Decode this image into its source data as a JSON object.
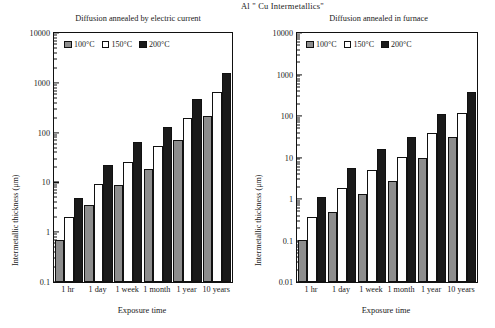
{
  "figure": {
    "main_title": "Al \" Cu Intermetallics\""
  },
  "chart_data": [
    {
      "type": "bar",
      "title": "Diffusion annealed by electric current",
      "xlabel": "Exposure time",
      "ylabel": "Intermetallic thickness (μm)",
      "yscale": "log",
      "ylim": [
        0.1,
        10000
      ],
      "ytick_labels": [
        "0.1",
        "1",
        "10",
        "100",
        "1000",
        "10000"
      ],
      "ytick_values": [
        0.1,
        1,
        10,
        100,
        1000,
        10000
      ],
      "grid": false,
      "legend_position": "upper-left-inside",
      "categories": [
        "1 hr",
        "1 day",
        "1 week",
        "1 month",
        "1 year",
        "10 years"
      ],
      "series": [
        {
          "name": "100°C",
          "color": "#8d8d8d",
          "values": [
            0.7,
            3.5,
            9,
            19,
            70,
            220
          ]
        },
        {
          "name": "150°C",
          "color": "#ffffff",
          "values": [
            2,
            9.5,
            26,
            55,
            200,
            650
          ]
        },
        {
          "name": "200°C",
          "color": "#1a1a1a",
          "values": [
            4.8,
            22,
            65,
            130,
            480,
            1550
          ]
        }
      ]
    },
    {
      "type": "bar",
      "title": "Diffusion annealed in furnace",
      "xlabel": "Exposure time",
      "ylabel": "Intermetallic thickness (μm)",
      "yscale": "log",
      "ylim": [
        0.01,
        10000
      ],
      "ytick_labels": [
        "0.01",
        "0.1",
        "1",
        "10",
        "100",
        "1000",
        "10000"
      ],
      "ytick_values": [
        0.01,
        0.1,
        1,
        10,
        100,
        1000,
        10000
      ],
      "grid": false,
      "legend_position": "upper-left-inside",
      "categories": [
        "1 hr",
        "1 day",
        "1 week",
        "1 month",
        "1 year",
        "10 years"
      ],
      "series": [
        {
          "name": "100°C",
          "color": "#8d8d8d",
          "values": [
            0.105,
            0.48,
            1.3,
            2.7,
            10,
            31
          ]
        },
        {
          "name": "150°C",
          "color": "#ffffff",
          "values": [
            0.37,
            1.85,
            5,
            10.5,
            38,
            120
          ]
        },
        {
          "name": "200°C",
          "color": "#1a1a1a",
          "values": [
            1.1,
            5.6,
            16,
            32,
            110,
            380
          ]
        }
      ]
    }
  ]
}
